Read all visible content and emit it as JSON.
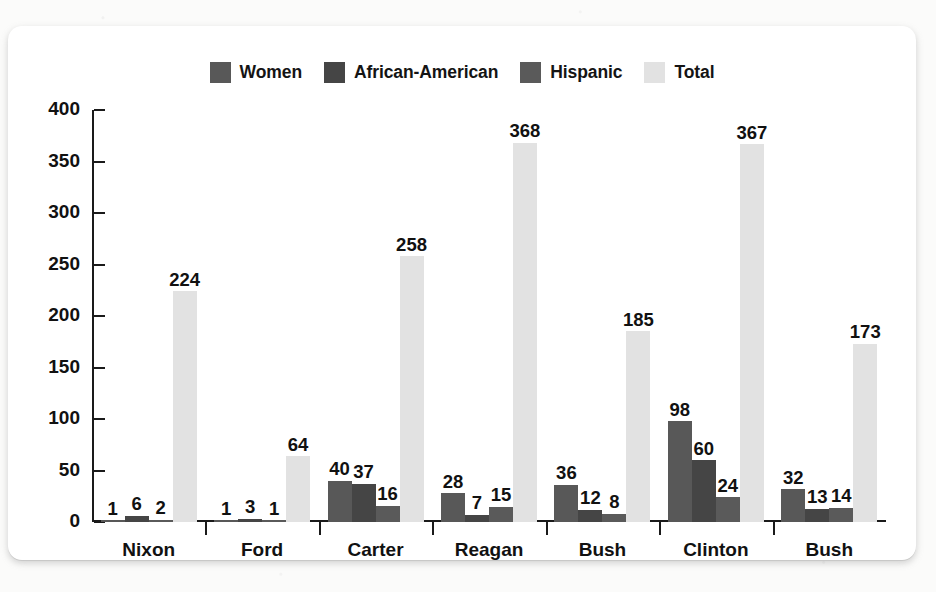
{
  "figure": {
    "card_background": "#ffffff",
    "page_background": "#fbfbfa"
  },
  "legend": {
    "position": "top-center",
    "items": [
      {
        "label": "Women",
        "color": "#585858",
        "swatch_name": "legend-swatch-women"
      },
      {
        "label": "African-American",
        "color": "#454545",
        "swatch_name": "legend-swatch-african-american"
      },
      {
        "label": "Hispanic",
        "color": "#5a5a5a",
        "swatch_name": "legend-swatch-hispanic"
      },
      {
        "label": "Total",
        "color": "#e2e2e2",
        "swatch_name": "legend-swatch-total"
      }
    ]
  },
  "yaxis": {
    "ticks": [
      "0",
      "50",
      "100",
      "150",
      "200",
      "250",
      "300",
      "350",
      "400"
    ],
    "min": 0,
    "max": 400,
    "step": 50
  },
  "chart_data": {
    "type": "bar",
    "title": "",
    "subtitle": "",
    "xlabel": "",
    "ylabel": "",
    "ylim": [
      0,
      400
    ],
    "ytick_step": 50,
    "grid": false,
    "legend_position": "top-center",
    "grouping": "grouped",
    "categories": [
      "Nixon",
      "Ford",
      "Carter",
      "Reagan",
      "Bush",
      "Clinton",
      "Bush"
    ],
    "series": [
      {
        "name": "Women",
        "color": "#585858",
        "values": [
          1,
          1,
          40,
          28,
          36,
          98,
          32
        ]
      },
      {
        "name": "African-American",
        "color": "#454545",
        "values": [
          6,
          3,
          37,
          7,
          12,
          60,
          13
        ]
      },
      {
        "name": "Hispanic",
        "color": "#5a5a5a",
        "values": [
          2,
          1,
          16,
          15,
          8,
          24,
          14
        ]
      },
      {
        "name": "Total",
        "color": "#e2e2e2",
        "values": [
          224,
          64,
          258,
          368,
          185,
          367,
          173
        ]
      }
    ],
    "data_labels": [
      {
        "category": "Nixon",
        "values": [
          "1",
          "6",
          "2",
          "224"
        ]
      },
      {
        "category": "Ford",
        "values": [
          "1",
          "3",
          "1",
          "64"
        ]
      },
      {
        "category": "Carter",
        "values": [
          "40",
          "37",
          "16",
          "258"
        ]
      },
      {
        "category": "Reagan",
        "values": [
          "28",
          "7",
          "15",
          "368"
        ]
      },
      {
        "category": "Bush",
        "values": [
          "36",
          "12",
          "8",
          "185"
        ]
      },
      {
        "category": "Clinton",
        "values": [
          "98",
          "60",
          "24",
          "367"
        ]
      },
      {
        "category": "Bush",
        "values": [
          "32",
          "13",
          "14",
          "173"
        ]
      }
    ]
  }
}
